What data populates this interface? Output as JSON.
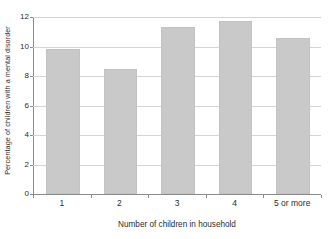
{
  "chart_data": {
    "type": "bar",
    "title": "",
    "categories": [
      "1",
      "2",
      "3",
      "4",
      "5 or more"
    ],
    "values": [
      9.8,
      8.5,
      11.3,
      11.75,
      10.55
    ],
    "series": [
      {
        "name": "Percentage of children with a mental disorder",
        "values": [
          9.8,
          8.5,
          11.3,
          11.75,
          10.55
        ]
      }
    ],
    "xlabel": "Number of children in household",
    "ylabel": "Percentage of children with a mental disorder",
    "ylim": [
      0,
      12
    ],
    "yticks": [
      0,
      2,
      4,
      6,
      8,
      10,
      12
    ],
    "ytick_labels": [
      "0",
      "2",
      "4",
      "6",
      "8",
      "10",
      "12"
    ],
    "grid": true,
    "legend": false,
    "bar_color": "#c9c9c9",
    "axis_color": "#8a8a8a",
    "grid_color": "#d4d4d4"
  }
}
